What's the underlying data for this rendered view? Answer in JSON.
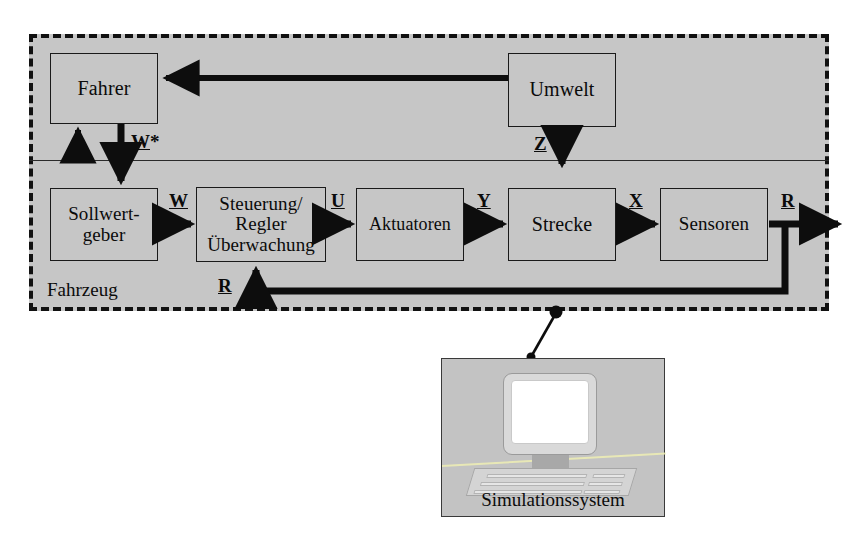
{
  "diagram": {
    "title_caption": "Fahrzeug",
    "frame": {
      "style": "dashed",
      "fill_color": "#c6c6c6",
      "border_color": "#111111"
    },
    "blocks": [
      {
        "id": "fahrer",
        "label": "Fahrer",
        "lines": [
          "Fahrer"
        ]
      },
      {
        "id": "umwelt",
        "label": "Umwelt",
        "lines": [
          "Umwelt"
        ]
      },
      {
        "id": "sollwert",
        "label": "Sollwertgeber",
        "lines": [
          "Sollwert-",
          "geber"
        ]
      },
      {
        "id": "steuerung",
        "label": "Steuerung/Regler Überwachung",
        "lines": [
          "Steuerung/",
          "Regler",
          "Überwachung"
        ]
      },
      {
        "id": "aktuatoren",
        "label": "Aktuatoren",
        "lines": [
          "Aktuatoren"
        ]
      },
      {
        "id": "strecke",
        "label": "Strecke",
        "lines": [
          "Strecke"
        ]
      },
      {
        "id": "sensoren",
        "label": "Sensoren",
        "lines": [
          "Sensoren"
        ]
      }
    ],
    "signals": [
      {
        "id": "wstar",
        "symbol": "W",
        "suffix": "*",
        "from": "fahrer",
        "to": "sollwert"
      },
      {
        "id": "z",
        "symbol": "Z",
        "suffix": "",
        "from": "umwelt",
        "to": "strecke"
      },
      {
        "id": "w",
        "symbol": "W",
        "suffix": "",
        "from": "sollwert",
        "to": "steuerung"
      },
      {
        "id": "u",
        "symbol": "U",
        "suffix": "",
        "from": "steuerung",
        "to": "aktuatoren"
      },
      {
        "id": "y",
        "symbol": "Y",
        "suffix": "",
        "from": "aktuatoren",
        "to": "strecke"
      },
      {
        "id": "x",
        "symbol": "X",
        "suffix": "",
        "from": "strecke",
        "to": "sensoren"
      },
      {
        "id": "r_out",
        "symbol": "R",
        "suffix": "",
        "from": "sensoren",
        "to": "extern"
      },
      {
        "id": "r_fb",
        "symbol": "R",
        "suffix": "",
        "from": "sensoren",
        "to": "steuerung"
      }
    ]
  },
  "simulation": {
    "panel_label": "Simulationssystem",
    "panel_fill": "#c3c3c3",
    "screen_fill": "#ffffff",
    "icon": "desktop-computer"
  }
}
